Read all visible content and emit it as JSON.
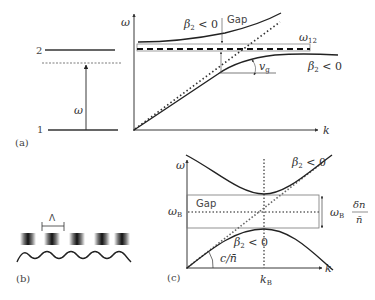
{
  "figure": {
    "panel_a": {
      "panel_label": "(a)",
      "levels": {
        "upper_label": "2",
        "lower_label": "1"
      },
      "transition_label": "ω",
      "chart": {
        "y_axis_label": "ω",
        "x_axis_label": "k",
        "upper_branch_label": "β",
        "upper_branch_sub": "2",
        "upper_branch_rel": " < 0",
        "gap_label": "Gap",
        "resonance_label": "ω",
        "resonance_sub": "12",
        "lower_branch_label": "β",
        "lower_branch_sub": "2",
        "lower_branch_rel": " < 0",
        "group_velocity_label": "v",
        "group_velocity_sub": "g"
      }
    },
    "panel_b": {
      "panel_label": "(b)",
      "period_label": "Λ",
      "grating_count": 5
    },
    "panel_c": {
      "panel_label": "(c)",
      "y_axis_label": "ω",
      "x_axis_label": "k",
      "bragg_freq_label": "ω",
      "bragg_freq_sub": "B",
      "bragg_k_label": "k",
      "bragg_k_sub": "B",
      "gap_label": "Gap",
      "upper_branch_label": "β",
      "upper_branch_sub": "2",
      "upper_branch_rel": " < 0",
      "lower_branch_label": "β",
      "lower_branch_sub": "2",
      "lower_branch_rel": " < 0",
      "slope_label": "c/n̄",
      "gap_width_prefix": "ω",
      "gap_width_sub": "B",
      "gap_width_num": "δn",
      "gap_width_den": "n̄"
    }
  }
}
